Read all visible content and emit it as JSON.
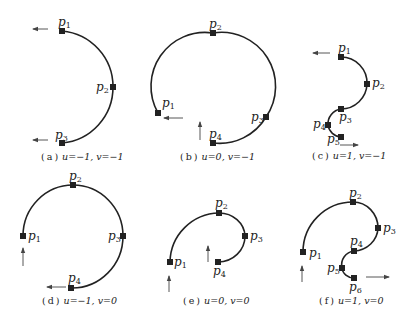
{
  "figure": {
    "panels": [
      {
        "id": "a",
        "caption": {
          "tag": "a",
          "u": "u=−1,",
          "v": "v=−1"
        },
        "points": [
          {
            "name": "p",
            "sub": "1",
            "x": 62,
            "y": 31
          },
          {
            "name": "p",
            "sub": "2",
            "x": 113,
            "y": 87
          },
          {
            "name": "p",
            "sub": "3",
            "x": 62,
            "y": 143
          }
        ],
        "arrows": [
          {
            "direction": "left",
            "x1": 48,
            "y1": 29,
            "x2": 33,
            "y2": 29
          },
          {
            "direction": "left",
            "x1": 48,
            "y1": 140,
            "x2": 33,
            "y2": 140
          }
        ]
      },
      {
        "id": "b",
        "caption": {
          "tag": "b",
          "u": "u=0,",
          "v": "v=−1"
        },
        "points": [
          {
            "name": "p",
            "sub": "1",
            "x": 158,
            "y": 113
          },
          {
            "name": "p",
            "sub": "2",
            "x": 213,
            "y": 33
          },
          {
            "name": "p",
            "sub": "3",
            "x": 266,
            "y": 117
          },
          {
            "name": "p",
            "sub": "4",
            "x": 213,
            "y": 143
          }
        ],
        "arrows": [
          {
            "direction": "left",
            "x1": 183,
            "y1": 118,
            "x2": 164,
            "y2": 118
          },
          {
            "direction": "up",
            "x1": 200,
            "y1": 140,
            "x2": 200,
            "y2": 122
          }
        ]
      },
      {
        "id": "c",
        "caption": {
          "tag": "c",
          "u": "u=1,",
          "v": "v=−1"
        },
        "points": [
          {
            "name": "p",
            "sub": "1",
            "x": 341,
            "y": 57
          },
          {
            "name": "p",
            "sub": "2",
            "x": 367,
            "y": 84
          },
          {
            "name": "p",
            "sub": "3",
            "x": 341,
            "y": 109
          },
          {
            "name": "p",
            "sub": "4",
            "x": 328,
            "y": 125
          },
          {
            "name": "p",
            "sub": "5",
            "x": 341,
            "y": 137
          }
        ],
        "arrows": [
          {
            "direction": "left",
            "x1": 330,
            "y1": 53,
            "x2": 313,
            "y2": 53
          },
          {
            "direction": "right",
            "x1": 340,
            "y1": 145,
            "x2": 358,
            "y2": 145
          }
        ]
      },
      {
        "id": "d",
        "caption": {
          "tag": "d",
          "u": "u=−1,",
          "v": "v=0"
        },
        "points": [
          {
            "name": "p",
            "sub": "1",
            "x": 23,
            "y": 236
          },
          {
            "name": "p",
            "sub": "2",
            "x": 73,
            "y": 185
          },
          {
            "name": "p",
            "sub": "3",
            "x": 123,
            "y": 236
          },
          {
            "name": "p",
            "sub": "4",
            "x": 71,
            "y": 288
          }
        ],
        "arrows": [
          {
            "direction": "up",
            "x1": 23,
            "y1": 266,
            "x2": 23,
            "y2": 248
          },
          {
            "direction": "left",
            "x1": 66,
            "y1": 287,
            "x2": 47,
            "y2": 287
          }
        ]
      },
      {
        "id": "e",
        "caption": {
          "tag": "e",
          "u": "u=0,",
          "v": "v=0"
        },
        "points": [
          {
            "name": "p",
            "sub": "1",
            "x": 170,
            "y": 262
          },
          {
            "name": "p",
            "sub": "2",
            "x": 219,
            "y": 213
          },
          {
            "name": "p",
            "sub": "3",
            "x": 245,
            "y": 236
          },
          {
            "name": "p",
            "sub": "4",
            "x": 218,
            "y": 262
          }
        ],
        "arrows": [
          {
            "direction": "up",
            "x1": 169,
            "y1": 292,
            "x2": 169,
            "y2": 276
          },
          {
            "direction": "up",
            "x1": 208,
            "y1": 262,
            "x2": 208,
            "y2": 246
          }
        ]
      },
      {
        "id": "f",
        "caption": {
          "tag": "f",
          "u": "u=1,",
          "v": "v=0"
        },
        "points": [
          {
            "name": "p",
            "sub": "1",
            "x": 303,
            "y": 252
          },
          {
            "name": "p",
            "sub": "2",
            "x": 353,
            "y": 202
          },
          {
            "name": "p",
            "sub": "3",
            "x": 378,
            "y": 228
          },
          {
            "name": "p",
            "sub": "4",
            "x": 354,
            "y": 251
          },
          {
            "name": "p",
            "sub": "5",
            "x": 342,
            "y": 268
          },
          {
            "name": "p",
            "sub": "6",
            "x": 354,
            "y": 278
          }
        ],
        "arrows": [
          {
            "direction": "up",
            "x1": 302,
            "y1": 282,
            "x2": 302,
            "y2": 266
          },
          {
            "direction": "right",
            "x1": 366,
            "y1": 277,
            "x2": 389,
            "y2": 277
          }
        ]
      }
    ]
  }
}
